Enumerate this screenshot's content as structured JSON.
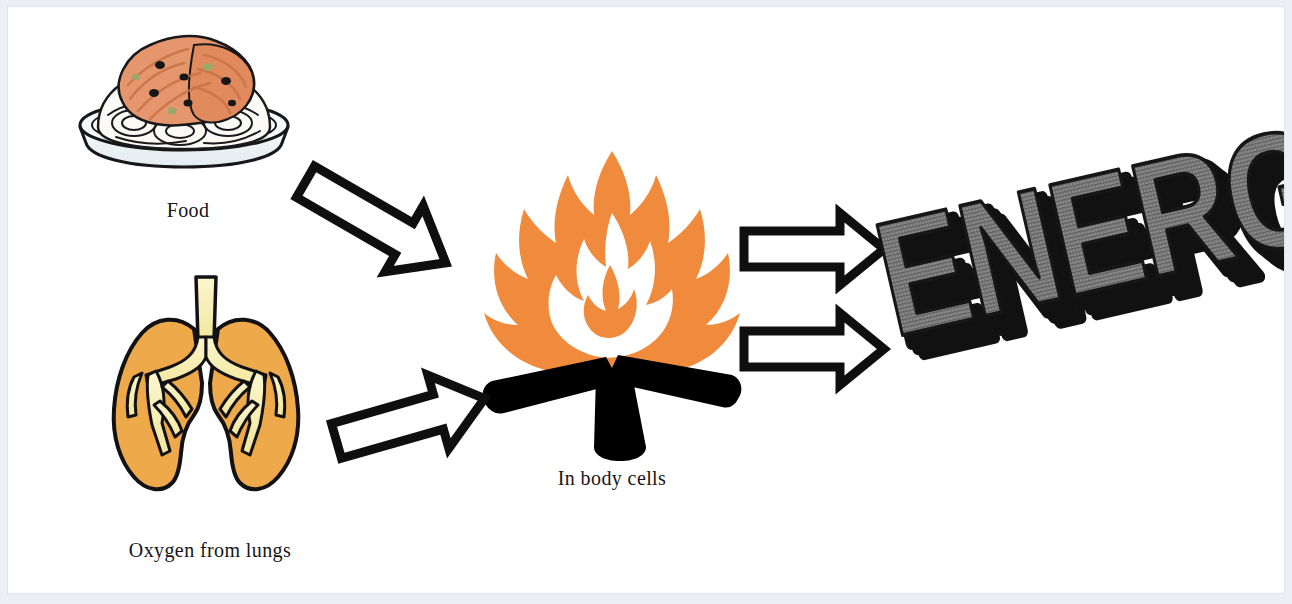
{
  "document": {
    "type": "biology-diagram",
    "title": "Respiration in body cells",
    "background_color": "#ffffff",
    "page_border_color": "#eceff3"
  },
  "diagram": {
    "flow_description": "Food and Oxygen from lungs combine in body cells (fire) to release ENERGY",
    "inputs": [
      {
        "id": "food",
        "caption": "Food",
        "icon": "plate-of-spaghetti-icon",
        "colors": {
          "sauce": "#e4946a",
          "pasta": "#f6f3ec",
          "plate": "#eef4f6",
          "outline": "#17171a"
        }
      },
      {
        "id": "oxygen",
        "caption": "Oxygen from lungs",
        "icon": "lungs-icon",
        "colors": {
          "lung_fill": "#eda94a",
          "bronchi_fill": "#f6eeb0",
          "outline": "#121214"
        }
      }
    ],
    "process": {
      "id": "body-cells",
      "caption": "In body cells",
      "icon": "campfire-icon",
      "colors": {
        "flame": "#f08a3c",
        "flame_inner": "#ffffff",
        "logs": "#000000"
      }
    },
    "output": {
      "id": "energy",
      "text": "ENERGY",
      "style": "3d-extruded-wordart",
      "colors": {
        "face": "#7c7c7c",
        "face_hatch": "#4d4d4d",
        "extrusion": "#111111"
      },
      "rotation_degrees": -13
    },
    "arrows": [
      {
        "id": "food-to-fire",
        "direction": "down-right",
        "angle_degrees": 30,
        "style": "hollow-block-arrow"
      },
      {
        "id": "lungs-to-fire",
        "direction": "up-right",
        "angle_degrees": -16,
        "style": "hollow-block-arrow"
      },
      {
        "id": "fire-to-energy-top",
        "direction": "right",
        "angle_degrees": 0,
        "style": "hollow-block-arrow"
      },
      {
        "id": "fire-to-energy-bottom",
        "direction": "right",
        "angle_degrees": 0,
        "style": "hollow-block-arrow"
      }
    ]
  },
  "captions": {
    "food": "Food",
    "oxygen": "Oxygen from lungs",
    "body_cells": "In body cells",
    "energy": "ENERGY"
  }
}
